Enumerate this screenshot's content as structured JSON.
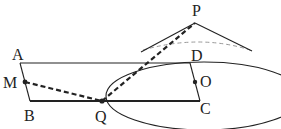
{
  "labels": {
    "P": "P",
    "A": "A",
    "D": "D",
    "M": "M",
    "O": "O",
    "B": "B",
    "Q": "Q",
    "C": "C"
  },
  "colors": {
    "stroke": "#222222",
    "hidden": "#999999"
  }
}
